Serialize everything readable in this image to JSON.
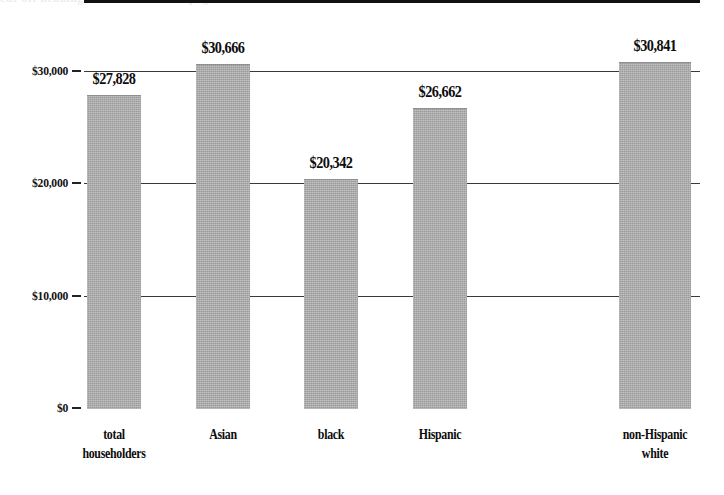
{
  "chart_data": {
    "type": "bar",
    "title": "",
    "xlabel": "",
    "ylabel": "",
    "categories": [
      "total householders",
      "Asian",
      "black",
      "Hispanic",
      "non-Hispanic white"
    ],
    "category_lines": [
      [
        "total",
        "householders"
      ],
      [
        "Asian",
        ""
      ],
      [
        "black",
        ""
      ],
      [
        "Hispanic",
        ""
      ],
      [
        "non-Hispanic",
        "white"
      ]
    ],
    "values": [
      27828,
      30666,
      20342,
      26662,
      30841
    ],
    "value_labels": [
      "$27,828",
      "$30,666",
      "$20,342",
      "$26,662",
      "$30,841"
    ],
    "ylim": [
      0,
      33000
    ],
    "ytick_values": [
      0,
      10000,
      20000,
      30000
    ],
    "ytick_labels": [
      "$0",
      "$10,000",
      "$20,000",
      "$30,000"
    ],
    "grid": true,
    "grid_axis": "y",
    "legend": false,
    "bar_color": "#a9a9a9",
    "axis_color": "#111111",
    "text_color": "#0d0d0d",
    "background": "#ffffff"
  },
  "artifact": {
    "top_strip_text": "cut-off heading text from scanned page above the chart"
  }
}
